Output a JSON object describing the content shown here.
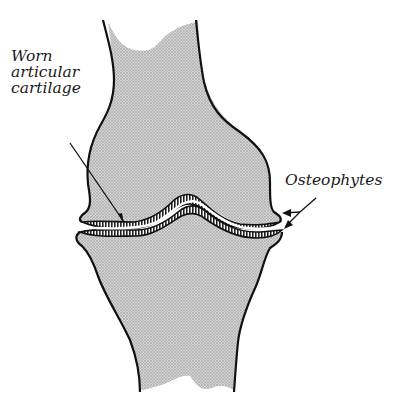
{
  "diagram": {
    "labels": {
      "worn_cartilage": [
        "Worn",
        "articular",
        "cartilage"
      ],
      "osteophytes": "Osteophytes"
    },
    "colors": {
      "bone_fill": "#c9c9c9",
      "outline": "#111111",
      "cartilage_fill": "#ffffff",
      "background": "#ffffff"
    }
  }
}
